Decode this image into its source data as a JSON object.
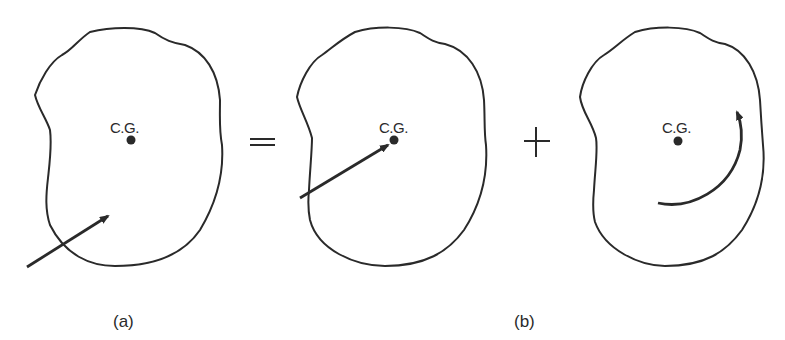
{
  "diagram": {
    "panels": [
      {
        "id": "a-body",
        "cg_label": "C.G.",
        "element": "force-arrow-offset"
      },
      {
        "id": "b-body-translation",
        "cg_label": "C.G.",
        "element": "force-arrow-through-cg"
      },
      {
        "id": "b-body-rotation",
        "cg_label": "C.G.",
        "element": "counterclockwise-moment-arc"
      }
    ],
    "operators": {
      "equals": "=",
      "plus": "+"
    },
    "captions": {
      "a": "(a)",
      "b": "(b)"
    },
    "colors": {
      "stroke": "#2a2a2a",
      "background": "#ffffff"
    }
  }
}
